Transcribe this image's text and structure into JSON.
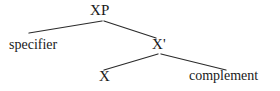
{
  "diagram": {
    "type": "syntax-tree",
    "background_color": "#ffffff",
    "line_color": "#2b2b2b",
    "text_color": "#1a1a1a",
    "nodes": [
      {
        "id": "xp",
        "label": "XP",
        "role": "phrase-node",
        "x": 104,
        "y": 11
      },
      {
        "id": "specifier",
        "label": "specifier",
        "role": "specifier-node",
        "x": 38,
        "y": 45
      },
      {
        "id": "xbar",
        "label": "X'",
        "role": "bar-level-node",
        "x": 159,
        "y": 45
      },
      {
        "id": "head",
        "label": "X",
        "role": "head-node",
        "x": 105,
        "y": 77
      },
      {
        "id": "complement",
        "label": "complement",
        "role": "complement-node",
        "x": 229,
        "y": 77
      }
    ],
    "edges": [
      {
        "from": "xp",
        "to": "specifier",
        "x1": 102,
        "y1": 21,
        "x2": 29,
        "y2": 33
      },
      {
        "from": "xp",
        "to": "xbar",
        "x1": 104,
        "y1": 21,
        "x2": 156,
        "y2": 38
      },
      {
        "from": "xbar",
        "to": "head",
        "x1": 158,
        "y1": 54,
        "x2": 104,
        "y2": 70
      },
      {
        "from": "xbar",
        "to": "complement",
        "x1": 161,
        "y1": 54,
        "x2": 226,
        "y2": 70
      }
    ]
  }
}
